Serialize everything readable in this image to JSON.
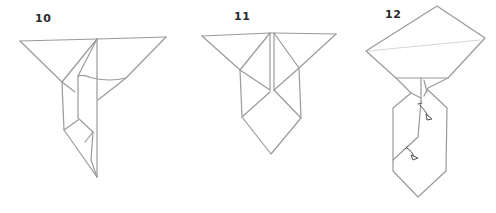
{
  "diagram": {
    "type": "origami-instruction-sequence",
    "steps": [
      {
        "number": "10",
        "description": "Tie shape with one side flap folded over the centre crease"
      },
      {
        "number": "11",
        "description": "Symmetric collar flaps with diamond-shaped lower point"
      },
      {
        "number": "12",
        "description": "Collar folded up into pentagon knot; two fold arrows indicate folding the tie edges"
      }
    ],
    "arrows": [
      {
        "step": "12",
        "label": "fold-arrow-upper"
      },
      {
        "step": "12",
        "label": "fold-arrow-lower"
      }
    ],
    "colors": {
      "line": "#9a9a9a",
      "label": "#2a2a2a",
      "arrow": "#555555",
      "background": "#ffffff"
    }
  }
}
